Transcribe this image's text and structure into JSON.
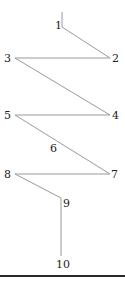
{
  "diagram": {
    "type": "zigzag-path",
    "line_color": "#9a9a9a",
    "label_color": "#222222",
    "nodes": [
      {
        "id": "1",
        "label": "1",
        "x": 62,
        "y": 27,
        "label_x": 55,
        "label_y": 20
      },
      {
        "id": "2",
        "label": "2",
        "x": 110,
        "y": 58,
        "label_x": 112,
        "label_y": 53
      },
      {
        "id": "3",
        "label": "3",
        "x": 15,
        "y": 58,
        "label_x": 4,
        "label_y": 53
      },
      {
        "id": "4",
        "label": "4",
        "x": 110,
        "y": 115,
        "label_x": 112,
        "label_y": 110
      },
      {
        "id": "5",
        "label": "5",
        "x": 15,
        "y": 115,
        "label_x": 4,
        "label_y": 110
      },
      {
        "id": "6",
        "label": "6",
        "x": 52,
        "y": 143,
        "label_x": 50,
        "label_y": 143
      },
      {
        "id": "7",
        "label": "7",
        "x": 110,
        "y": 174,
        "label_x": 111,
        "label_y": 169
      },
      {
        "id": "8",
        "label": "8",
        "x": 15,
        "y": 174,
        "label_x": 4,
        "label_y": 169
      },
      {
        "id": "9",
        "label": "9",
        "x": 61,
        "y": 198,
        "label_x": 63,
        "label_y": 198
      },
      {
        "id": "10",
        "label": "10",
        "x": 61,
        "y": 256,
        "label_x": 56,
        "label_y": 259
      }
    ],
    "start_tick": {
      "x": 62,
      "y1": 12,
      "y2": 27
    },
    "path": [
      [
        62,
        27
      ],
      [
        110,
        58
      ],
      [
        15,
        58
      ],
      [
        110,
        115
      ],
      [
        15,
        115
      ],
      [
        110,
        174
      ],
      [
        15,
        174
      ],
      [
        61,
        198
      ],
      [
        61,
        256
      ]
    ]
  }
}
